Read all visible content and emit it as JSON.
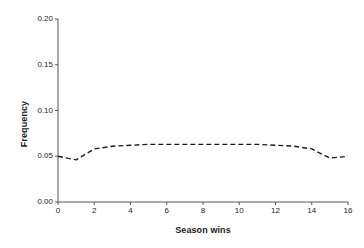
{
  "chart_data": {
    "type": "line",
    "title": "",
    "xlabel": "Season wins",
    "ylabel": "Frequency",
    "xlim": [
      0,
      16
    ],
    "ylim": [
      0.0,
      0.2
    ],
    "grid": false,
    "legend": null,
    "line_style": "dashed",
    "line_color": "#1a1a1a",
    "x_ticks": [
      "0",
      "2",
      "4",
      "6",
      "8",
      "10",
      "12",
      "14",
      "16"
    ],
    "x_tick_values": [
      0,
      2,
      4,
      6,
      8,
      10,
      12,
      14,
      16
    ],
    "y_ticks": [
      "0.00",
      "0.05",
      "0.10",
      "0.15",
      "0.20"
    ],
    "y_tick_values": [
      0.0,
      0.05,
      0.1,
      0.15,
      0.2
    ],
    "x": [
      0,
      1,
      2,
      3,
      4,
      5,
      6,
      7,
      8,
      9,
      10,
      11,
      12,
      13,
      14,
      15,
      16
    ],
    "values": [
      0.05,
      0.046,
      0.058,
      0.061,
      0.062,
      0.063,
      0.063,
      0.063,
      0.063,
      0.063,
      0.063,
      0.063,
      0.062,
      0.061,
      0.058,
      0.048,
      0.05
    ],
    "series": [
      {
        "name": "Season wins frequency",
        "values": [
          0.05,
          0.046,
          0.058,
          0.061,
          0.062,
          0.063,
          0.063,
          0.063,
          0.063,
          0.063,
          0.063,
          0.063,
          0.062,
          0.061,
          0.058,
          0.048,
          0.05
        ]
      }
    ]
  },
  "axes": {
    "axis_color": "#555555",
    "tick_color": "#555555",
    "background": "#ffffff"
  }
}
